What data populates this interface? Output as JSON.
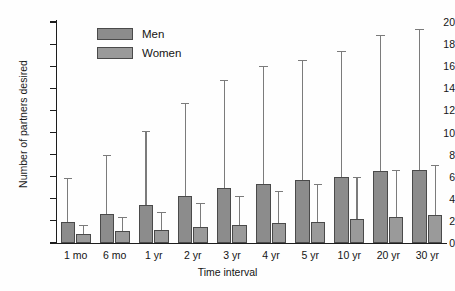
{
  "chart_data": {
    "type": "bar",
    "title": "",
    "xlabel": "Time interval",
    "ylabel": "Number of partners desired",
    "categories": [
      "1 mo",
      "6 mo",
      "1 yr",
      "2 yr",
      "3 yr",
      "4 yr",
      "5 yr",
      "10 yr",
      "20 yr",
      "30 yr"
    ],
    "ylim": [
      0,
      20
    ],
    "yticks": [
      0,
      2,
      4,
      6,
      8,
      10,
      12,
      14,
      16,
      18,
      20
    ],
    "grid": false,
    "legend_position": "upper-left-inside",
    "error_bars": "upper only",
    "series": [
      {
        "name": "Men",
        "color": "#8c8c8c",
        "values": [
          1.9,
          2.6,
          3.4,
          4.25,
          5.0,
          5.35,
          5.7,
          6.0,
          6.5,
          6.65
        ],
        "error_top": [
          5.9,
          8.0,
          10.1,
          12.65,
          14.75,
          16.0,
          16.6,
          17.35,
          18.8,
          19.4
        ]
      },
      {
        "name": "Women",
        "color": "#9a9a9a",
        "values": [
          0.85,
          1.05,
          1.2,
          1.45,
          1.65,
          1.8,
          1.9,
          2.2,
          2.35,
          2.5
        ],
        "error_top": [
          1.6,
          2.35,
          2.85,
          3.6,
          4.25,
          4.7,
          5.35,
          6.0,
          6.65,
          7.1
        ]
      }
    ]
  },
  "legend": {
    "items": [
      {
        "label": "Men"
      },
      {
        "label": "Women"
      }
    ]
  },
  "axes": {
    "y_title": "Number of partners desired",
    "x_title": "Time interval"
  }
}
